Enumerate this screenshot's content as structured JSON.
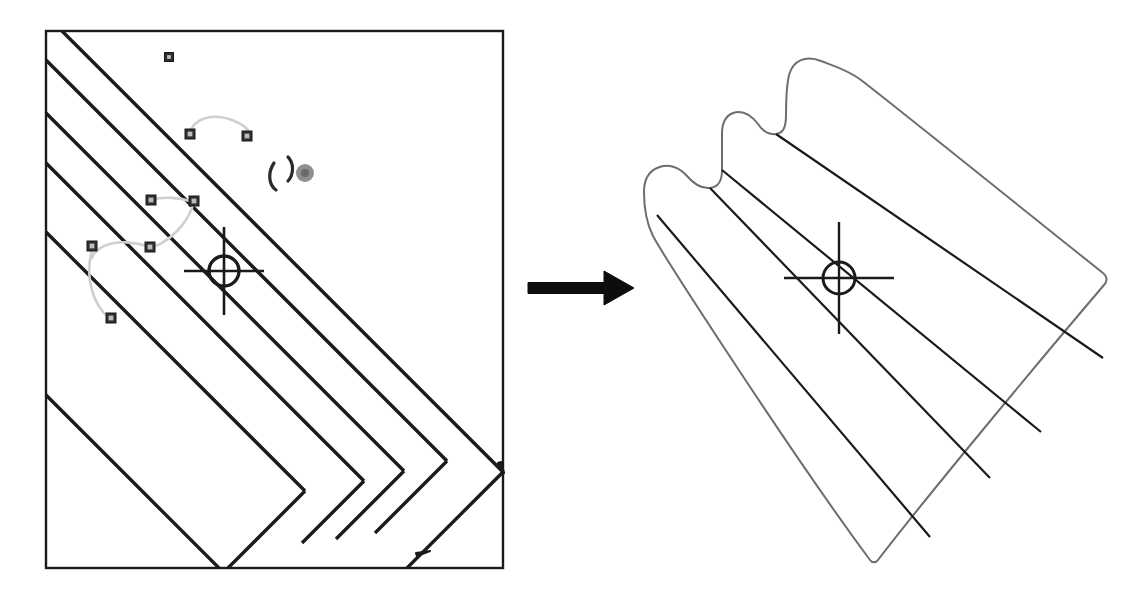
{
  "figure": {
    "kind": "technical-illustration",
    "caption": "",
    "background_color": "#ffffff",
    "ink_color": "#1a1a1a",
    "light_ink_color": "#6e6e6e",
    "marker_color": "#4a4a4a",
    "path_color": "#c9c9c9"
  },
  "panels": [
    {
      "id": "left-panel",
      "name": "source-image-panel",
      "label": "",
      "frame": {
        "x": 46,
        "y": 31,
        "width": 457,
        "height": 537,
        "stroke": "#1a1a1a",
        "stroke_width": 2.4
      },
      "description": "Bordered grayscale image tile containing diagonal parallel ridge lines, seed-point markers joined by light curved paths, a circled crosshair target and a small gray blob marker."
    },
    {
      "id": "right-panel",
      "name": "result-shape-panel",
      "label": "",
      "frame": {
        "x": 600,
        "y": 40,
        "width": 540,
        "height": 550
      },
      "description": "Extracted region outline with scalloped upper boundary, interior ridge lines and the same circled crosshair target."
    }
  ],
  "arrow": {
    "name": "transition-arrow",
    "label": "",
    "direction": "right",
    "x1": 528,
    "y1": 288,
    "x2": 634,
    "y2": 288,
    "shaft_width": 11,
    "head_length": 30,
    "head_width": 34,
    "color": "#0d0d0d"
  },
  "left_panel_content": {
    "ridge_lines": [
      {
        "name": "ridge-line-1",
        "x1": 60,
        "y1": 29,
        "x2": 503,
        "y2": 472,
        "width": 3.4
      },
      {
        "name": "ridge-line-2",
        "x1": 46,
        "y1": 60,
        "x2": 447,
        "y2": 461,
        "width": 3.4
      },
      {
        "name": "ridge-line-3",
        "x1": 46,
        "y1": 113,
        "x2": 404,
        "y2": 471,
        "width": 3.4
      },
      {
        "name": "ridge-line-4",
        "x1": 46,
        "y1": 163,
        "x2": 364,
        "y2": 481,
        "width": 3.4
      },
      {
        "name": "ridge-line-5",
        "x1": 46,
        "y1": 232,
        "x2": 305,
        "y2": 491,
        "width": 3.4
      },
      {
        "name": "ridge-line-6",
        "x1": 46,
        "y1": 395,
        "x2": 222,
        "y2": 571,
        "width": 3.4
      }
    ],
    "ridge_lines_down": [
      {
        "name": "ridge-edge-a",
        "x1": 503,
        "y1": 472,
        "x2": 398,
        "y2": 577,
        "width": 3.4
      },
      {
        "name": "ridge-edge-b",
        "x1": 447,
        "y1": 461,
        "x2": 375,
        "y2": 533,
        "width": 3.4
      },
      {
        "name": "ridge-edge-c",
        "x1": 404,
        "y1": 471,
        "x2": 336,
        "y2": 539,
        "width": 3.4
      },
      {
        "name": "ridge-edge-d",
        "x1": 364,
        "y1": 481,
        "x2": 302,
        "y2": 543,
        "width": 3.4
      },
      {
        "name": "ridge-edge-e",
        "x1": 305,
        "y1": 491,
        "x2": 222,
        "y2": 574,
        "width": 3.4
      },
      {
        "name": "ridge-edge-f",
        "x1": 222,
        "y1": 571,
        "x2": 222,
        "y2": 571,
        "width": 3.4
      }
    ],
    "markers": [
      {
        "name": "seed-marker-1",
        "x": 169,
        "y": 57,
        "size": 9
      },
      {
        "name": "seed-marker-2",
        "x": 190,
        "y": 134,
        "size": 10
      },
      {
        "name": "seed-marker-3",
        "x": 247,
        "y": 136,
        "size": 10
      },
      {
        "name": "seed-marker-4",
        "x": 151,
        "y": 200,
        "size": 10
      },
      {
        "name": "seed-marker-5",
        "x": 194,
        "y": 201,
        "size": 10
      },
      {
        "name": "seed-marker-6",
        "x": 92,
        "y": 246,
        "size": 10
      },
      {
        "name": "seed-marker-7",
        "x": 150,
        "y": 247,
        "size": 10
      },
      {
        "name": "seed-marker-8",
        "x": 111,
        "y": 318,
        "size": 10
      }
    ],
    "linking_paths": [
      {
        "name": "link-path-top",
        "d": "M190,134 C192,120 210,112 232,120 C246,126 250,130 249,136",
        "color": "#cfcfcf",
        "width": 2.6
      },
      {
        "name": "link-path-mid",
        "d": "M151,200 C164,196 180,198 190,201",
        "color": "#cfcfcf",
        "width": 2.6
      },
      {
        "name": "link-path-mid2",
        "d": "M194,201 C190,218 178,234 160,244 C156,246 153,247 151,247",
        "color": "#cfcfcf",
        "width": 2.6
      },
      {
        "name": "link-path-low",
        "d": "M150,247 C136,242 118,240 104,246 C96,250 93,254 92,258",
        "color": "#cfcfcf",
        "width": 2.6
      },
      {
        "name": "link-path-bottom",
        "d": "M92,250 C86,272 90,296 103,312 C107,316 109,317 111,318",
        "color": "#cfcfcf",
        "width": 2.6
      }
    ],
    "crosshair": {
      "name": "crosshair-target-left",
      "cx": 224,
      "cy": 271,
      "radius": 15,
      "ring_width": 3.4,
      "arm_h_half": 40,
      "arm_v_half": 44,
      "arm_width": 2.6,
      "color": "#1a1a1a"
    },
    "hook_mark": {
      "name": "hook-annotation-mark",
      "d": "M274,163 C268,172 268,184 276,190 M288,157 C294,163 294,174 288,181",
      "color": "#2b2b2b",
      "width": 3.2
    },
    "blob_marker": {
      "name": "blob-marker",
      "cx": 305,
      "cy": 173,
      "r": 9,
      "inner_r": 4,
      "color": "#8f8f8f",
      "inner_color": "#6a6a6a"
    },
    "edge_ticks": [
      {
        "name": "edge-tick-right",
        "d": "M498,463 l6,10 l-3,-11 z",
        "color": "#1a1a1a"
      },
      {
        "name": "edge-tick-bottom",
        "d": "M417,556 l13,-5 l-14,2 z",
        "color": "#1a1a1a"
      }
    ]
  },
  "right_panel_content": {
    "outline": {
      "name": "extracted-region-outline",
      "d": "M821,61 C806,55 793,60 789,75 C786,88 786,100 786,115 C786,128 783,133 776,134 C768,135 762,130 758,124 C751,115 742,110 733,113 C725,116 722,123 722,134 C722,147 722,160 722,170 C722,182 718,187 710,188 C700,189 693,183 687,176 C679,167 668,163 657,168 C648,172 644,180 644,192 C644,208 646,222 653,236 C665,258 790,452 870,560 C872,563 876,563 878,560 C920,505 1035,366 1104,285 C1108,281 1107,276 1103,273 C1040,223 900,110 861,80 C848,70 834,66 821,61 Z",
      "stroke": "#6e6e6e",
      "stroke_width": 2.0,
      "fill": "none"
    },
    "interior_lines": [
      {
        "name": "result-ridge-1",
        "x1": 776,
        "y1": 134,
        "x2": 1103,
        "y2": 358,
        "width": 2.2
      },
      {
        "name": "result-ridge-2",
        "x1": 722,
        "y1": 170,
        "x2": 1041,
        "y2": 432,
        "width": 2.2
      },
      {
        "name": "result-ridge-3",
        "x1": 710,
        "y1": 188,
        "x2": 990,
        "y2": 478,
        "width": 2.2
      },
      {
        "name": "result-ridge-4",
        "x1": 657,
        "y1": 215,
        "x2": 930,
        "y2": 537,
        "width": 2.2
      }
    ],
    "crosshair": {
      "name": "crosshair-target-right",
      "cx": 839,
      "cy": 278,
      "radius": 16,
      "ring_width": 3.0,
      "arm_h_half": 55,
      "arm_v_half": 56,
      "arm_width": 2.4,
      "color": "#1a1a1a"
    }
  }
}
